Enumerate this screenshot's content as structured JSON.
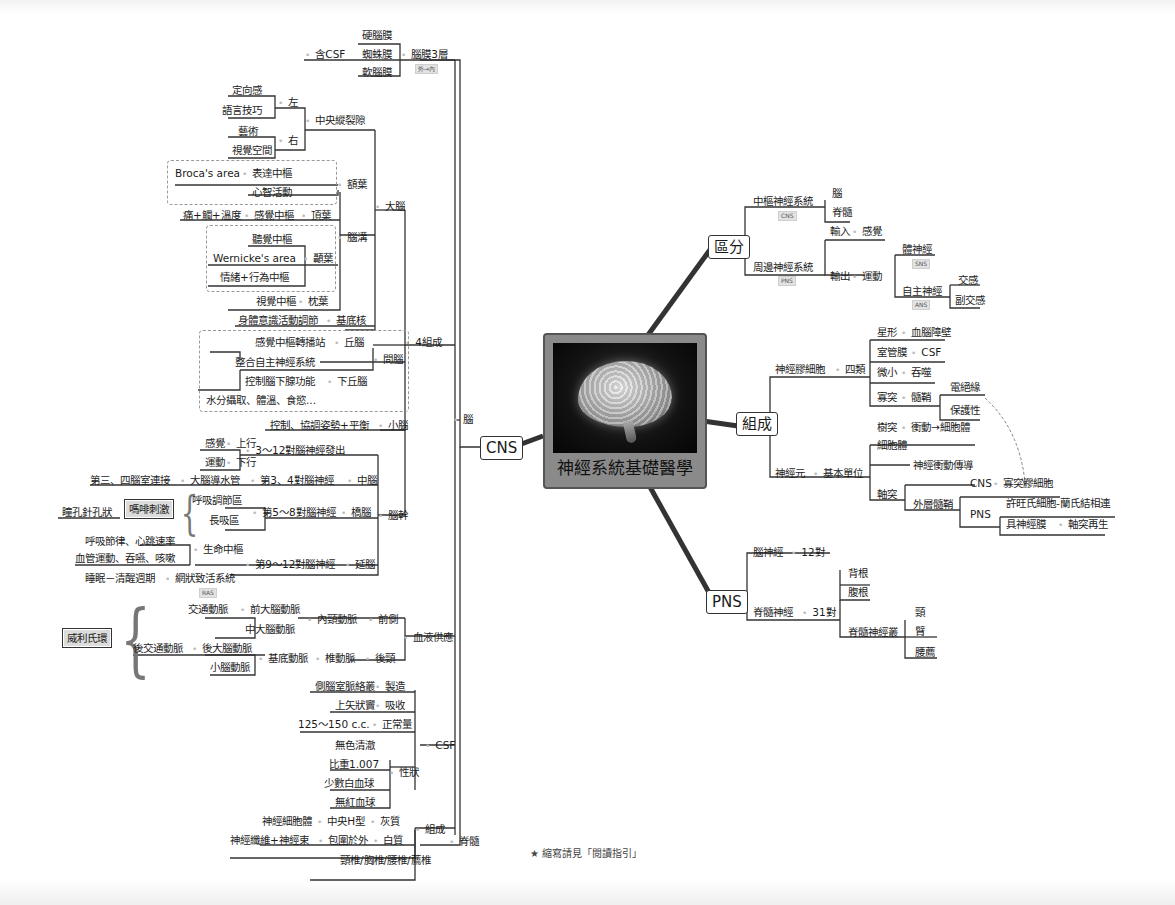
{
  "center": {
    "title": "神經系統基礎醫學",
    "image": "brain-illustration"
  },
  "main_branches": {
    "cns": "CNS",
    "classify": "區分",
    "compose": "組成",
    "pns": "PNS"
  },
  "cns": {
    "brain": "腦",
    "four": "4組成",
    "meninges": {
      "label": "腦膜3層",
      "tag": "外→內",
      "items": [
        "硬腦膜",
        "蜘蛛膜",
        "軟腦膜"
      ],
      "csf_note": "含CSF"
    },
    "cerebrum": {
      "label": "大腦",
      "fissure": {
        "label": "中央縱裂隙",
        "left": "左",
        "left_items": [
          "定向感",
          "語言技巧"
        ],
        "right": "右",
        "right_items": [
          "藝術",
          "視覺空間"
        ]
      },
      "sulci": {
        "label": "腦溝",
        "frontal": {
          "label": "額葉",
          "broca": "Broca's area",
          "broca_fn": "表達中樞",
          "mind": "心智活動"
        },
        "parietal": {
          "label": "頂葉",
          "center": "感覺中樞",
          "detail": "痛+觸+溫度"
        },
        "temporal": {
          "label": "顳葉",
          "items": [
            "聽覺中樞",
            "Wernicke's area",
            "情緒+行為中樞"
          ]
        },
        "occipital": {
          "label": "枕葉",
          "center": "視覺中樞"
        }
      },
      "basal": {
        "label": "基底核",
        "fn": "身體意識活動調節"
      }
    },
    "diencephalon": {
      "label": "間腦",
      "thalamus": {
        "label": "丘腦",
        "fn": "感覺中樞轉播站"
      },
      "hypothalamus": {
        "label": "下丘腦",
        "items": [
          "整合自主神經系統",
          "控制腦下腺功能",
          "水分攝取、體溫、食慾..."
        ]
      }
    },
    "cerebellum": {
      "label": "小腦",
      "fn": "控制、協調姿勢+平衡"
    },
    "brainstem": {
      "label": "腦幹",
      "cranial": "3～12對腦神經發出",
      "up": "上行",
      "up_fn": "感覺",
      "down": "下行",
      "down_fn": "運動",
      "midbrain": {
        "label": "中腦",
        "nerves": "第3、4對腦神經",
        "aqueduct": "大腦導水管",
        "aq_fn": "第三、四腦室連接"
      },
      "pons": {
        "label": "橋腦",
        "nerves": "第5～8對腦神經",
        "items": [
          "呼吸調節區",
          "長吸區"
        ],
        "morphine": "嗎啡刺激",
        "pupil": "瞳孔針孔狀"
      },
      "medulla": {
        "label": "延腦",
        "nerves": "第9～12對腦神經",
        "vital": "生命中樞",
        "vital_items": [
          "呼吸節律、心跳速率",
          "血管運動、吞嚥、咳嗽"
        ],
        "ras": "網狀致活系統",
        "ras_tag": "RAS",
        "sleep": "睡眠－清醒週期"
      }
    },
    "blood": {
      "label": "血液供應",
      "anterior": "前側",
      "internal": "內頸動脈",
      "ant_items": [
        "前大腦動脈",
        "中大腦動脈"
      ],
      "ant_comm": "交通動脈",
      "posterior": "後頸",
      "vertebral": "椎動脈",
      "basilar": "基底動脈",
      "post_items": [
        "後大腦動脈",
        "小腦動脈"
      ],
      "post_comm": "後交通動脈",
      "willis": "威利氏環"
    },
    "csf": {
      "label": "CSF",
      "make": "製造",
      "make_src": "側腦室脈絡叢",
      "absorb": "吸收",
      "absorb_src": "上矢狀竇",
      "normal": "正常量",
      "normal_val": "125～150 c.c.",
      "props": "性狀",
      "prop_items": [
        "無色清澈",
        "比重1.007",
        "少數白血球",
        "無紅血球"
      ]
    },
    "spinal": {
      "label": "脊髓",
      "compose": "組成",
      "gray": "灰質",
      "gray_shape": "中央H型",
      "gray_src": "神經細胞體",
      "white": "白質",
      "white_pos": "包圍於外",
      "white_src": "神經纖維+神經束",
      "segments": "頸椎/胸椎/腰椎/薦椎"
    }
  },
  "classify": {
    "central": "中樞神經系統",
    "central_tag": "CNS",
    "central_items": [
      "腦",
      "脊髓"
    ],
    "peripheral": "周邊神經系統",
    "peripheral_tag": "PNS",
    "input": "輸入",
    "input_fn": "感覺",
    "output": "輸出",
    "motor": "運動",
    "somatic": "體神經",
    "somatic_tag": "SNS",
    "autonomic": "自主神經",
    "autonomic_tag": "ANS",
    "autonomic_items": [
      "交感",
      "副交感"
    ]
  },
  "compose": {
    "glia": "神經膠細胞",
    "four": "四類",
    "glia_items": [
      {
        "k": "星形",
        "v": "血腦障壁"
      },
      {
        "k": "室管膜",
        "v": "CSF"
      },
      {
        "k": "微小",
        "v": "吞噬"
      },
      {
        "k": "寡突",
        "v": "髓鞘"
      }
    ],
    "myelin_items": [
      "電絕緣",
      "保護性"
    ],
    "neuron": "神經元",
    "unit": "基本單位",
    "dendrite": "樹突",
    "dendrite_fn": "衝動→細胞體",
    "soma": "細胞體",
    "axon": "軸突",
    "axon_fn": "神經衝動傳導",
    "outer": "外層髓鞘",
    "cns": "CNS",
    "cns_cell": "寡突膠細胞",
    "pns": "PNS",
    "pns_items": [
      "許旺氏細胞-蘭氏結相連",
      "具神經膜"
    ],
    "regen": "軸突再生"
  },
  "pns": {
    "cranial": "腦神經",
    "cranial_n": "12對",
    "spinal": "脊髓神經",
    "spinal_n": "31對",
    "roots": [
      "背根",
      "腹根"
    ],
    "plexus": "脊髓神經叢",
    "plexus_items": [
      "頸",
      "臂",
      "腰薦"
    ]
  },
  "footnote": "★ 縮寫請見「閱讀指引」"
}
